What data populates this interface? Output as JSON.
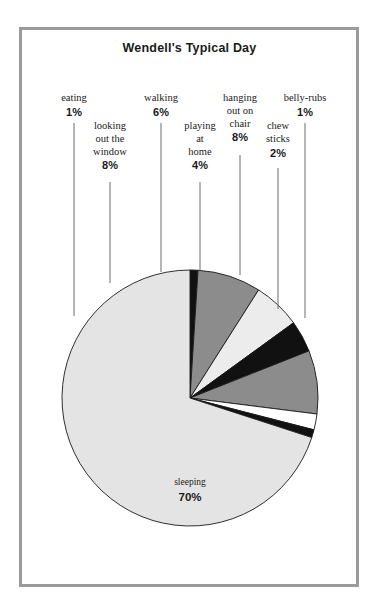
{
  "frame": {
    "border_color": "#9b9b9b",
    "background": "#ffffff"
  },
  "header": {
    "title": "Wendell's Typical Day"
  },
  "chart_data": {
    "type": "pie",
    "title": "Wendell's Typical Day",
    "xlabel": "",
    "ylabel": "",
    "legend_position": "callout-labels",
    "grid": false,
    "units": "percent",
    "total": 100,
    "categories": [
      "eating",
      "looking out the window",
      "walking",
      "playing at home",
      "hanging out on chair",
      "chew sticks",
      "belly-rubs",
      "sleeping"
    ],
    "values": [
      1,
      8,
      6,
      4,
      8,
      2,
      1,
      70
    ],
    "colors": [
      "#111111",
      "#8c8c8c",
      "#ececec",
      "#111111",
      "#8c8c8c",
      "#ffffff",
      "#111111",
      "#e4e4e4"
    ],
    "slices": [
      {
        "name": "eating",
        "value": 1,
        "pct_label": "1%",
        "color": "#111111",
        "label_lines": [
          "eating"
        ],
        "label_x": 74,
        "label_y": 92,
        "leader_x": 74,
        "leader_y_top": 123,
        "leader_y_bottom": 316
      },
      {
        "name": "looking out the window",
        "value": 8,
        "pct_label": "8%",
        "color": "#8c8c8c",
        "label_lines": [
          "looking",
          "out the",
          "window"
        ],
        "label_x": 110,
        "label_y": 120,
        "leader_x": 110,
        "leader_y_top": 182,
        "leader_y_bottom": 283
      },
      {
        "name": "walking",
        "value": 6,
        "pct_label": "6%",
        "color": "#ececec",
        "label_lines": [
          "walking"
        ],
        "label_x": 161,
        "label_y": 92,
        "leader_x": 161,
        "leader_y_top": 123,
        "leader_y_bottom": 272
      },
      {
        "name": "playing at home",
        "value": 4,
        "pct_label": "4%",
        "color": "#111111",
        "label_lines": [
          "playing",
          "at",
          "home"
        ],
        "label_x": 200,
        "label_y": 120,
        "leader_x": 200,
        "leader_y_top": 182,
        "leader_y_bottom": 270
      },
      {
        "name": "hanging out on chair",
        "value": 8,
        "pct_label": "8%",
        "color": "#8c8c8c",
        "label_lines": [
          "hanging",
          "out on",
          "chair"
        ],
        "label_x": 240,
        "label_y": 92,
        "leader_x": 240,
        "leader_y_top": 155,
        "leader_y_bottom": 275
      },
      {
        "name": "chew sticks",
        "value": 2,
        "pct_label": "2%",
        "color": "#ffffff",
        "label_lines": [
          "chew",
          "sticks"
        ],
        "label_x": 278,
        "label_y": 120,
        "leader_x": 278,
        "leader_y_top": 168,
        "leader_y_bottom": 309
      },
      {
        "name": "belly-rubs",
        "value": 1,
        "pct_label": "1%",
        "color": "#111111",
        "label_lines": [
          "belly-rubs"
        ],
        "label_x": 305,
        "label_y": 92,
        "leader_x": 305,
        "leader_y_top": 123,
        "leader_y_bottom": 318
      },
      {
        "name": "sleeping",
        "value": 70,
        "pct_label": "70%",
        "color": "#e4e4e4",
        "label_lines": [
          "sleeping"
        ],
        "label_x": 190,
        "label_y": 477,
        "inside": true
      }
    ],
    "geometry": {
      "cx": 190,
      "cy": 398,
      "r": 128,
      "start_angle_deg": -90,
      "direction": "clockwise"
    }
  }
}
